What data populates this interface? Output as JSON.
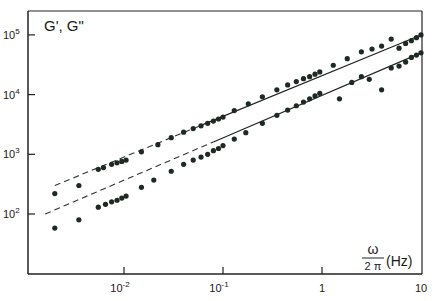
{
  "chart_data": {
    "type": "scatter",
    "title": "",
    "ylabel": "G', G\"",
    "xlabel": "ω / 2π (Hz)",
    "xlabel_num": "ω",
    "xlabel_den": "2 π",
    "xlabel_unit": "(Hz)",
    "xscale": "log",
    "yscale": "log",
    "xlim": [
      0.0012,
      10
    ],
    "ylim": [
      25,
      200000
    ],
    "grid": false,
    "legend": null,
    "x_ticks": [
      {
        "value": 0.01,
        "label_base": "10",
        "label_exp": "-2"
      },
      {
        "value": 0.1,
        "label_base": "10",
        "label_exp": "-1"
      },
      {
        "value": 1,
        "label_base": "1",
        "label_exp": ""
      },
      {
        "value": 10,
        "label_base": "10",
        "label_exp": ""
      }
    ],
    "y_ticks": [
      {
        "value": 100,
        "label_base": "10",
        "label_exp": "2"
      },
      {
        "value": 1000,
        "label_base": "10",
        "label_exp": "3"
      },
      {
        "value": 10000,
        "label_base": "10",
        "label_exp": "4"
      },
      {
        "value": 100000,
        "label_base": "10",
        "label_exp": "5"
      }
    ],
    "series": [
      {
        "name": "upper (G\")",
        "x": [
          0.002,
          0.0035,
          0.0055,
          0.0062,
          0.0075,
          0.0085,
          0.0095,
          0.0105,
          0.015,
          0.022,
          0.03,
          0.04,
          0.05,
          0.06,
          0.07,
          0.08,
          0.09,
          0.1,
          0.13,
          0.18,
          0.25,
          0.35,
          0.45,
          0.55,
          0.65,
          0.75,
          0.85,
          0.95,
          1.3,
          1.8,
          2.5,
          3.2,
          4,
          5,
          6,
          7,
          8,
          9,
          10
        ],
        "y": [
          220,
          300,
          560,
          600,
          680,
          720,
          760,
          800,
          1100,
          1450,
          1900,
          2350,
          2700,
          3000,
          3300,
          3600,
          3900,
          4200,
          5400,
          7000,
          9200,
          12000,
          14500,
          16500,
          18500,
          20000,
          22000,
          24000,
          31000,
          40000,
          52000,
          58000,
          65000,
          85000,
          60000,
          72000,
          80000,
          90000,
          100000
        ]
      },
      {
        "name": "lower (G')",
        "x": [
          0.002,
          0.0035,
          0.0055,
          0.0065,
          0.0075,
          0.0085,
          0.0095,
          0.0105,
          0.015,
          0.02,
          0.03,
          0.04,
          0.05,
          0.06,
          0.07,
          0.08,
          0.09,
          0.1,
          0.13,
          0.17,
          0.25,
          0.35,
          0.45,
          0.55,
          0.65,
          0.75,
          0.85,
          0.95,
          1.5,
          2,
          2.5,
          3,
          4,
          5,
          6,
          7,
          8,
          9,
          10
        ],
        "y": [
          58,
          80,
          130,
          145,
          160,
          170,
          185,
          200,
          280,
          370,
          520,
          680,
          800,
          900,
          1000,
          1150,
          1250,
          1400,
          1800,
          2300,
          3300,
          4500,
          5500,
          6500,
          7500,
          8500,
          9500,
          10500,
          8500,
          16000,
          20000,
          18000,
          12000,
          28000,
          30000,
          35000,
          42000,
          46000,
          50000
        ]
      }
    ],
    "fit_lines": [
      {
        "name": "upper fit",
        "x_start": 0.002,
        "y_start": 300,
        "x_dash_end": 0.06,
        "x_end": 10,
        "y_end": 100000,
        "style": "dashed-then-solid"
      },
      {
        "name": "lower fit",
        "x_start": 0.0016,
        "y_start": 100,
        "x_dash_end": 0.08,
        "x_end": 10,
        "y_end": 50000,
        "style": "dashed-then-solid"
      }
    ]
  }
}
